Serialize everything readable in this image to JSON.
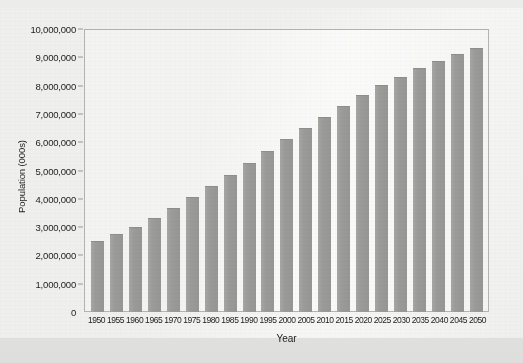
{
  "chart_data": {
    "type": "bar",
    "title": "",
    "xlabel": "Year",
    "ylabel": "Population (000s)",
    "ylim": [
      0,
      10000000
    ],
    "ytick_values": [
      0,
      1000000,
      2000000,
      3000000,
      4000000,
      5000000,
      6000000,
      7000000,
      8000000,
      9000000,
      10000000
    ],
    "ytick_labels": [
      "0",
      "1,000,000",
      "2,000,000",
      "3,000,000",
      "4,000,000",
      "5,000,000",
      "6,000,000",
      "7,000,000",
      "8,000,000",
      "9,000,000",
      "10,000,000"
    ],
    "grid": false,
    "legend": false,
    "bar_color": "#9b9b99",
    "categories": [
      "1950",
      "1955",
      "1960",
      "1965",
      "1970",
      "1975",
      "1980",
      "1985",
      "1990",
      "1995",
      "2000",
      "2005",
      "2010",
      "2015",
      "2020",
      "2025",
      "2030",
      "2035",
      "2040",
      "2045",
      "2050"
    ],
    "values": [
      2520000,
      2760000,
      3020000,
      3330000,
      3690000,
      4070000,
      4440000,
      4850000,
      5280000,
      5690000,
      6120000,
      6510000,
      6890000,
      7290000,
      7670000,
      8010000,
      8320000,
      8610000,
      8870000,
      9100000,
      9320000
    ]
  }
}
